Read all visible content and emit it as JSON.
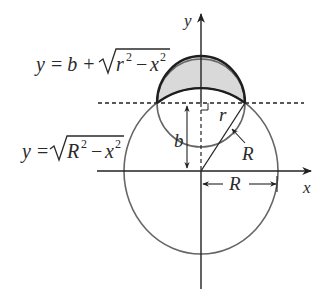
{
  "figure": {
    "type": "geometry-diagram",
    "colors": {
      "stroke": "#222222",
      "circle_stroke": "#666666",
      "shade": "#d9d9d9",
      "background": "#ffffff"
    }
  },
  "axes": {
    "x_label": "x",
    "y_label": "y"
  },
  "equations": {
    "upper": {
      "lhs": "y",
      "eq": "=",
      "b": "b",
      "plus": "+",
      "radicand_base1": "r",
      "exp1": "2",
      "minus": "−",
      "radicand_base2": "x",
      "exp2": "2"
    },
    "lower": {
      "lhs": "y",
      "eq": "=",
      "radicand_base1": "R",
      "exp1": "2",
      "minus": "−",
      "radicand_base2": "x",
      "exp2": "2"
    }
  },
  "labels": {
    "small_radius": "r",
    "height": "b",
    "large_radius_slant": "R",
    "large_radius_horizontal": "R"
  }
}
